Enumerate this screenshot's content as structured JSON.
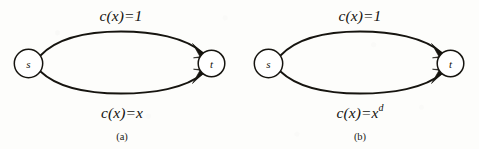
{
  "figure": {
    "background_color": "#fdfdfb",
    "ink_color": "#16140f",
    "panels": [
      {
        "id": "a",
        "caption": "(a)",
        "source_node_label": "s",
        "target_node_label": "t",
        "top_edge_label": "c(x)=1",
        "bottom_edge_label_base": "c(x)=x",
        "bottom_edge_label_sup": ""
      },
      {
        "id": "b",
        "caption": "(b)",
        "source_node_label": "s",
        "target_node_label": "t",
        "top_edge_label": "c(x)=1",
        "bottom_edge_label_base": "c(x)=x",
        "bottom_edge_label_sup": "d"
      }
    ]
  }
}
